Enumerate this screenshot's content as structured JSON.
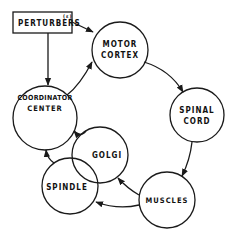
{
  "diagram": {
    "stroke_color": "#1a1a1a",
    "background": "#ffffff",
    "nodes": {
      "perturbers": {
        "label": "PERTURBERS",
        "superscript": "(ε)",
        "shape": "rect"
      },
      "motor_cortex": {
        "line1": "MOTOR",
        "line2": "CORTEX",
        "shape": "circle"
      },
      "spinal_cord": {
        "line1": "SPINAL",
        "line2": "CORD",
        "shape": "circle"
      },
      "muscles": {
        "label": "MUSCLES",
        "shape": "circle"
      },
      "coordinator_center": {
        "line1": "COORDINATOR",
        "line2": "CENTER",
        "shape": "circle"
      },
      "golgi": {
        "label": "GOLGI",
        "shape": "circle"
      },
      "spindle": {
        "label": "SPINDLE",
        "shape": "circle"
      }
    },
    "edges": [
      {
        "from": "perturbers",
        "to": "motor_cortex"
      },
      {
        "from": "perturbers",
        "to": "coordinator_center"
      },
      {
        "from": "coordinator_center",
        "to": "motor_cortex"
      },
      {
        "from": "motor_cortex",
        "to": "spinal_cord"
      },
      {
        "from": "spinal_cord",
        "to": "muscles"
      },
      {
        "from": "muscles",
        "to": "golgi"
      },
      {
        "from": "muscles",
        "to": "spindle"
      },
      {
        "from": "golgi",
        "to": "coordinator_center"
      },
      {
        "from": "spindle",
        "to": "coordinator_center"
      }
    ]
  }
}
